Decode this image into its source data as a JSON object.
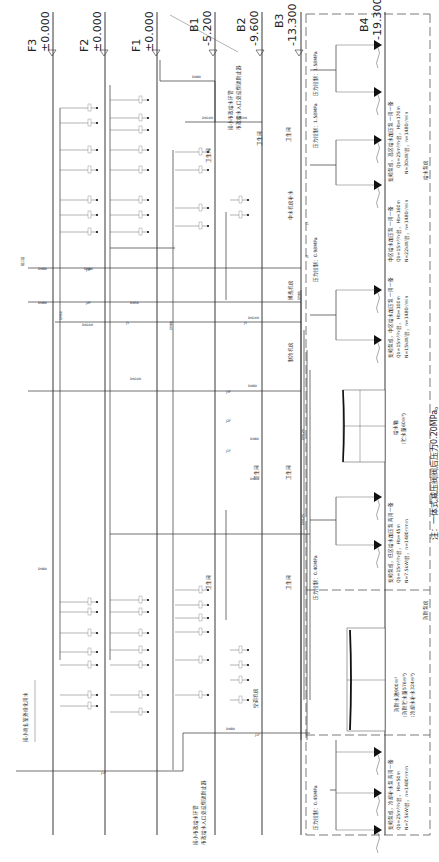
{
  "diagram": {
    "type": "water-supply-riser-diagram",
    "orientation": "rotated-90-cw",
    "levels": [
      {
        "name": "F3",
        "elevation": "±0.000",
        "x": 157
      },
      {
        "name": "F2",
        "elevation": "±0.000",
        "x": 315
      },
      {
        "name": "F1",
        "elevation": "±0.000",
        "x": 468
      },
      {
        "name": "B1",
        "elevation": "-5.200",
        "x": 640
      },
      {
        "name": "B2",
        "elevation": "-9.600",
        "x": 785
      },
      {
        "name": "B3",
        "elevation": "-13.300",
        "x": 902
      },
      {
        "name": "B4",
        "elevation": "-19.300",
        "x": 1080
      }
    ],
    "rooms": {
      "toilet": "卫生间",
      "hvac_room": "空调机房",
      "chiller_room": "制冷机房",
      "heat_exchange_room": "换热机房",
      "reclaimed_water_room": "中水机房补水",
      "pump_room_supply": "给水泵房",
      "pump_room_fire": "消防泵房",
      "third_floor": "接三层"
    },
    "pipe_sizes": [
      "DN15",
      "DN20",
      "DN25",
      "DN32",
      "DN40",
      "DN50",
      "DN65",
      "DN80",
      "DN100",
      "DN125",
      "DN150"
    ],
    "pipe_labels": {
      "j1": "J1",
      "j2": "J2",
      "j3": "J3",
      "j1f": "J1F",
      "j2f": "J2F",
      "j3f": "J3F",
      "dn80": "DN80",
      "dn100": "DN100",
      "dn125": "DN125",
      "dn150": "DN150",
      "dn50": "DN50",
      "dn25": "DN25",
      "dn20": "DN20",
      "dn15": "DN15",
      "dn32": "DN32",
      "dn40": "DN40"
    },
    "annotations": {
      "municipal_inlet_1": "接小市政给水环管",
      "municipal_inlet_1b": "市政给水入口处设倒流防止器",
      "municipal_inlet_2": "接小市政给水环管",
      "municipal_inlet_2b": "市政给水入口处设倒流防止器",
      "outdoor_greening": "接小商业室外绿化用水",
      "pressure_high": "压力控制：1.58MPa",
      "pressure_high2": "压力控制：1.58MPa",
      "pressure_mid": "压力控制：0.98MPa",
      "pressure_low": "压力控制：0.40MPa",
      "pressure_cool": "压力控制：0.45MPa"
    },
    "pump_groups": [
      {
        "id": "high-zone",
        "title": "变频泵组，高区给水加压泵  一用一备",
        "flow": "Qb=25m³/h·台，Hb=170m",
        "power": "N=30kW/台，n=1480r/min"
      },
      {
        "id": "mid-zone-a",
        "title": "中区给水加压泵  一用一备",
        "flow": "Qb=15m³/h·台，Hb=160m",
        "power": "N=22kW/台，n=1480r/min"
      },
      {
        "id": "mid-zone-b",
        "title": "变频泵组，中区给水加压泵  一用一备",
        "flow": "Qb=15m³/h·台，Hb=100m",
        "power": "N=15kW/台，n=1480r/min"
      },
      {
        "id": "low-zone",
        "title": "变频泵组，低区给水加压泵  两用一备",
        "flow": "Qb=15m³/h·台，Hb=45m",
        "power": "N=7.5kW/台，n=1480r/min"
      },
      {
        "id": "cooling-makeup",
        "title": "变频泵组，冷却补水泵  两用一备",
        "flow": "Qb=25m³/h·台，Hb=50m",
        "power": "N=7.5kW/台，n=1480r/min"
      }
    ],
    "tanks": [
      {
        "id": "supply-tank",
        "name": "给水箱",
        "volume": "（贮水量60m³）"
      },
      {
        "id": "fire-cooling-tank",
        "name": "消防水池900m³",
        "volume1": "（消防贮水量576m³）",
        "volume2": "（冷却水补水324m³）"
      }
    ],
    "pump_room_labels": {
      "supply": "给水泵房",
      "fire": "消防泵房"
    },
    "note": "注：一体式减压阀阀后压力0.20MPa。"
  }
}
